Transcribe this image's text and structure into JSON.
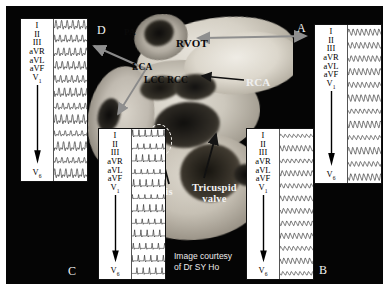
{
  "figure": {
    "background_color": "#050505",
    "credit": "Image courtesy\nof Dr SY Ho",
    "credit_line1": "Image courtesy",
    "credit_line2": "of Dr SY Ho"
  },
  "panel_letters": {
    "a": "A",
    "b": "B",
    "c": "C",
    "d": "D"
  },
  "anatomy_labels": [
    {
      "id": "pa",
      "text": "PA",
      "full_name": "pulmonary artery"
    },
    {
      "id": "rvot",
      "text": "RVOT",
      "full_name": "right ventricular outflow tract"
    },
    {
      "id": "lca",
      "text": "LCA",
      "full_name": "left coronary artery"
    },
    {
      "id": "lcc",
      "text": "LCC",
      "full_name": "left coronary cusp"
    },
    {
      "id": "rcc",
      "text": "RCC",
      "full_name": "right coronary cusp"
    },
    {
      "id": "rca",
      "text": "RCA",
      "full_name": "right coronary artery"
    },
    {
      "id": "his",
      "text": "His",
      "full_name": "His bundle"
    },
    {
      "id": "tv",
      "text": "Tricuspid\nvalve",
      "full_name": "tricuspid valve"
    }
  ],
  "anatomy_text": {
    "pa": "PA",
    "rvot": "RVOT",
    "lca": "LCA",
    "lcc": "LCC",
    "rcc": "RCC",
    "rca": "RCA",
    "his": "His",
    "tv_line1": "Tricuspid",
    "tv_line2": "valve"
  },
  "ecg": {
    "lead_labels": [
      "I",
      "II",
      "III",
      "aVR",
      "aVL",
      "aVF"
    ],
    "first_precordial": "V",
    "first_precordial_sub": "1",
    "last_precordial": "V",
    "last_precordial_sub": "6",
    "arrow_direction": "down",
    "trace_color": "#2b2b2b",
    "paper_color": "#ffffff",
    "panels": [
      {
        "letter": "D",
        "rows": 12,
        "morphology": "broad biphasic complexes, upright in I-III, deep negative aVR, notched V leads",
        "amplitude_scale": 1.0
      },
      {
        "letter": "A",
        "rows": 12,
        "morphology": "repetitive rounded sinusoidal wide complexes across all leads",
        "amplitude_scale": 0.75
      },
      {
        "letter": "C",
        "rows": 12,
        "morphology": "tall narrow spiked R waves with isoelectric baseline",
        "amplitude_scale": 1.1
      },
      {
        "letter": "B",
        "rows": 12,
        "morphology": "low-amplitude undulating sinusoidal complexes, negative deflections in V1",
        "amplitude_scale": 0.65
      }
    ]
  },
  "markers": {
    "his_ellipse": "dashed-ellipse-his-location"
  }
}
